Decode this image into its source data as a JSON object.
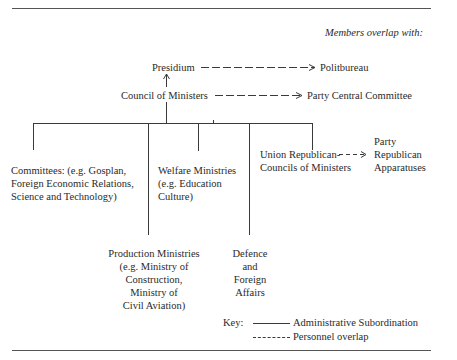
{
  "header": {
    "overlap_label": "Members overlap with:"
  },
  "nodes": {
    "presidium": "Presidium",
    "politbureau": "Politbureau",
    "council": "Council of Ministers",
    "central_committee": "Party Central Committee",
    "committees": [
      "Committees: (e.g. Gosplan,",
      "Foreign Economic Relations,",
      "Science and Technology)"
    ],
    "welfare": [
      "Welfare Ministries",
      "(e.g. Education",
      "Culture)"
    ],
    "union_republican": [
      "Union Republican-",
      "Councils of Ministers"
    ],
    "party_republican": [
      "Party",
      "Republican",
      "Apparatuses"
    ],
    "production": [
      "Production Ministries",
      "(e.g. Ministry of",
      "Construction,",
      "Ministry of",
      "Civil Aviation)"
    ],
    "defence": [
      "Defence",
      "and",
      "Foreign",
      "Affairs"
    ]
  },
  "key": {
    "label": "Key:",
    "solid": "Administrative Subordination",
    "dashed": "Personnel overlap"
  }
}
